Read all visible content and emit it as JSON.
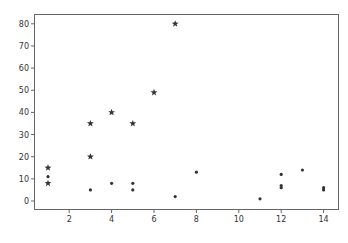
{
  "chart_data": {
    "type": "scatter",
    "title": "",
    "xlabel": "",
    "ylabel": "",
    "xlim": [
      0.4,
      14.7
    ],
    "ylim": [
      -3.9,
      84
    ],
    "grid": false,
    "legend": null,
    "xticks": [
      2,
      4,
      6,
      8,
      10,
      12,
      14
    ],
    "yticks": [
      0,
      10,
      20,
      30,
      40,
      50,
      60,
      70,
      80
    ],
    "series": [
      {
        "name": "stars",
        "marker": "star",
        "color": "#333333",
        "points": [
          {
            "x": 1,
            "y": 15
          },
          {
            "x": 1,
            "y": 8
          },
          {
            "x": 3,
            "y": 35
          },
          {
            "x": 3,
            "y": 20
          },
          {
            "x": 4,
            "y": 40
          },
          {
            "x": 5,
            "y": 35
          },
          {
            "x": 6,
            "y": 49
          },
          {
            "x": 7,
            "y": 80
          }
        ]
      },
      {
        "name": "dots",
        "marker": "circle",
        "color": "#333333",
        "points": [
          {
            "x": 1,
            "y": 11
          },
          {
            "x": 3,
            "y": 5
          },
          {
            "x": 4,
            "y": 8
          },
          {
            "x": 5,
            "y": 8
          },
          {
            "x": 5,
            "y": 5
          },
          {
            "x": 7,
            "y": 2
          },
          {
            "x": 8,
            "y": 13
          },
          {
            "x": 11,
            "y": 1
          },
          {
            "x": 12,
            "y": 12
          },
          {
            "x": 12,
            "y": 7
          },
          {
            "x": 12,
            "y": 6
          },
          {
            "x": 13,
            "y": 14
          },
          {
            "x": 14,
            "y": 6
          },
          {
            "x": 14,
            "y": 5
          }
        ]
      }
    ]
  },
  "colors": {
    "axes": "#555555",
    "marker": "#333333",
    "background": "#ffffff"
  }
}
